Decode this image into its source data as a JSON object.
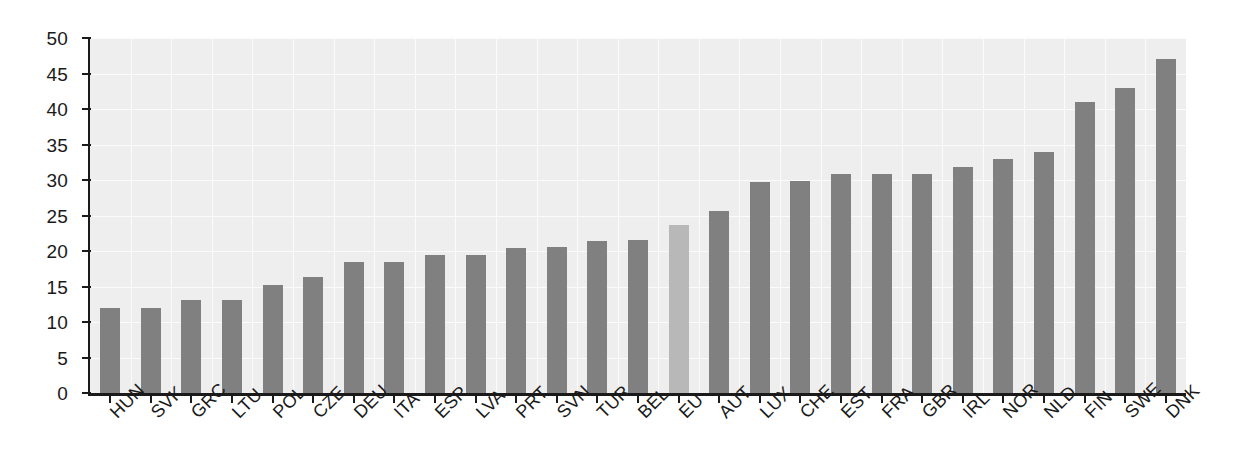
{
  "chart_data": {
    "type": "bar",
    "title": "",
    "subtitle": "",
    "xlabel": "",
    "ylabel": "",
    "ylim": [
      0,
      50
    ],
    "ytick_step": 5,
    "grid": true,
    "legend": "none",
    "highlight_category": "EU",
    "categories": [
      "HUN",
      "SVK",
      "GRC",
      "LTU",
      "POL",
      "CZE",
      "DEU",
      "ITA",
      "ESP",
      "LVA",
      "PRT",
      "SVN",
      "TUR",
      "BEL",
      "EU",
      "AUT",
      "LUX",
      "CHE",
      "EST",
      "FRA",
      "GBR",
      "IRL",
      "NOR",
      "NLD",
      "FIN",
      "SWE",
      "DNK"
    ],
    "values": [
      12.0,
      12.0,
      13.1,
      13.1,
      15.2,
      16.3,
      18.4,
      18.4,
      19.4,
      19.5,
      20.4,
      20.5,
      21.4,
      21.6,
      23.6,
      25.6,
      29.7,
      29.8,
      30.8,
      30.8,
      30.8,
      31.8,
      33.0,
      34.0,
      41.0,
      43.0,
      47.0
    ],
    "ytick_labels": [
      "0",
      "5",
      "10",
      "15",
      "20",
      "25",
      "30",
      "35",
      "40",
      "45",
      "50"
    ],
    "ytick_values": [
      0,
      5,
      10,
      15,
      20,
      25,
      30,
      35,
      40,
      45,
      50
    ],
    "colors": {
      "bar": "#808080",
      "bar_highlight": "#b8b8b8",
      "plot_background": "#eeeeee",
      "gridline": "#fbfbfb",
      "axis": "#1a1a1a",
      "text": "#1a1a1a"
    }
  }
}
